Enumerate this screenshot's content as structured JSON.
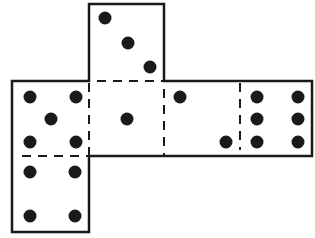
{
  "diagram": {
    "colors": {
      "line": "#1a1a1a",
      "pip": "#1a1a1a",
      "background": "#ffffff"
    },
    "faces": [
      {
        "id": "top",
        "pips": 3,
        "x": 89,
        "y": 4,
        "w": 75,
        "h": 77,
        "dots": [
          [
            105,
            18
          ],
          [
            128,
            43
          ],
          [
            150,
            67
          ]
        ]
      },
      {
        "id": "left",
        "pips": 5,
        "x": 12,
        "y": 81,
        "w": 77,
        "h": 75,
        "dots": [
          [
            30,
            97
          ],
          [
            76,
            97
          ],
          [
            51,
            119
          ],
          [
            30,
            142
          ],
          [
            76,
            142
          ]
        ]
      },
      {
        "id": "center",
        "pips": 1,
        "x": 89,
        "y": 81,
        "w": 75,
        "h": 75,
        "dots": [
          [
            127,
            119
          ]
        ]
      },
      {
        "id": "right",
        "pips": 2,
        "x": 164,
        "y": 81,
        "w": 76,
        "h": 75,
        "dots": [
          [
            180,
            97
          ],
          [
            226,
            142
          ]
        ]
      },
      {
        "id": "far-right",
        "pips": 6,
        "x": 240,
        "y": 81,
        "w": 72,
        "h": 75,
        "dots": [
          [
            257,
            97
          ],
          [
            298,
            97
          ],
          [
            257,
            119
          ],
          [
            298,
            119
          ],
          [
            257,
            142
          ],
          [
            298,
            142
          ]
        ]
      },
      {
        "id": "bottom",
        "pips": 4,
        "x": 12,
        "y": 156,
        "w": 77,
        "h": 76,
        "dots": [
          [
            30,
            172
          ],
          [
            75,
            172
          ],
          [
            30,
            216
          ],
          [
            75,
            216
          ]
        ]
      }
    ]
  }
}
